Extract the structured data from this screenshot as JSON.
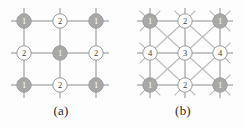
{
  "figure": {
    "background_color": "#fdfdfd",
    "edge_color": "#b3b3b3",
    "edge_color_diagonal": "#bcbcbc",
    "node_shaded_fill": "#a8a8a8",
    "node_plain_fill": "#fefefe",
    "node_stroke": "#9a9a9a",
    "label_color": "#3a3a3a",
    "label_color_shaded": "#ffffff",
    "node_radius": 7.2,
    "stub_length": 13
  },
  "panels": [
    {
      "id": "a",
      "caption": "(a)",
      "lattice": {
        "type": "square-grid",
        "rows": 3,
        "cols": 3,
        "degree": 4,
        "diagonals": false,
        "origin_x": 24,
        "origin_y": 21,
        "spacing_x": 36,
        "spacing_y": 32
      },
      "nodes": [
        {
          "row": 0,
          "col": 0,
          "label": "1",
          "shaded": true
        },
        {
          "row": 0,
          "col": 1,
          "label": "2",
          "shaded": false
        },
        {
          "row": 0,
          "col": 2,
          "label": "1",
          "shaded": true
        },
        {
          "row": 1,
          "col": 0,
          "label": "2",
          "shaded": false
        },
        {
          "row": 1,
          "col": 1,
          "label": "1",
          "shaded": true
        },
        {
          "row": 1,
          "col": 2,
          "label": "2",
          "shaded": false
        },
        {
          "row": 2,
          "col": 0,
          "label": "1",
          "shaded": true
        },
        {
          "row": 2,
          "col": 1,
          "label": "2",
          "shaded": false
        },
        {
          "row": 2,
          "col": 2,
          "label": "1",
          "shaded": true
        }
      ]
    },
    {
      "id": "b",
      "caption": "(b)",
      "lattice": {
        "type": "square-grid-with-diagonals",
        "rows": 3,
        "cols": 3,
        "degree": 8,
        "diagonals": true,
        "origin_x": 28,
        "origin_y": 21,
        "spacing_x": 35,
        "spacing_y": 32
      },
      "nodes": [
        {
          "row": 0,
          "col": 0,
          "label": "1",
          "shaded": true
        },
        {
          "row": 0,
          "col": 1,
          "label": "2",
          "shaded": false
        },
        {
          "row": 0,
          "col": 2,
          "label": "1",
          "shaded": true
        },
        {
          "row": 1,
          "col": 0,
          "label": "4",
          "shaded": false
        },
        {
          "row": 1,
          "col": 1,
          "label": "3",
          "shaded": false
        },
        {
          "row": 1,
          "col": 2,
          "label": "4",
          "shaded": false
        },
        {
          "row": 2,
          "col": 0,
          "label": "1",
          "shaded": true
        },
        {
          "row": 2,
          "col": 1,
          "label": "2",
          "shaded": false
        },
        {
          "row": 2,
          "col": 2,
          "label": "1",
          "shaded": true
        }
      ]
    }
  ]
}
